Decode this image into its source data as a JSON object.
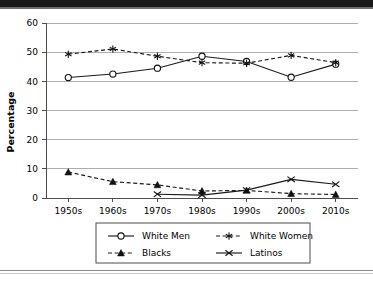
{
  "chart_data": {
    "type": "line",
    "title": "",
    "xlabel": "",
    "ylabel": "Percentage",
    "categories": [
      "1950s",
      "1960s",
      "1970s",
      "1980s",
      "1990s",
      "2000s",
      "2010s"
    ],
    "ylim": [
      0,
      60
    ],
    "ytick_step": 10,
    "yticks": [
      "0",
      "10",
      "20",
      "30",
      "40",
      "50",
      "60"
    ],
    "grid": "horizontal",
    "legend_position": "bottom",
    "series": [
      {
        "name": "White Men",
        "marker": "open-circle",
        "line_style": "solid",
        "values": [
          41.3,
          42.5,
          44.5,
          48.6,
          46.8,
          41.4,
          45.9
        ]
      },
      {
        "name": "White Women",
        "marker": "asterisk",
        "line_style": "dashed",
        "values": [
          49.3,
          51.1,
          48.6,
          46.4,
          46.2,
          48.9,
          46.4
        ]
      },
      {
        "name": "Blacks",
        "marker": "filled-triangle",
        "line_style": "dashed",
        "values": [
          8.9,
          5.6,
          4.5,
          2.4,
          2.6,
          1.5,
          1.2
        ]
      },
      {
        "name": "Latinos",
        "marker": "cross-x",
        "line_style": "solid",
        "values": [
          null,
          null,
          1.3,
          1.0,
          2.7,
          6.4,
          4.7
        ]
      }
    ]
  },
  "legend": {
    "entries": [
      {
        "label": "White Men",
        "key": "white-men"
      },
      {
        "label": "White Women",
        "key": "white-women"
      },
      {
        "label": "Blacks",
        "key": "blacks"
      },
      {
        "label": "Latinos",
        "key": "latinos"
      }
    ]
  },
  "colors": {
    "line": "#1a1a1a",
    "grid": "#9a9a9a",
    "axis": "#4d4d4d",
    "background": "#ffffff",
    "band": "#19181a"
  }
}
